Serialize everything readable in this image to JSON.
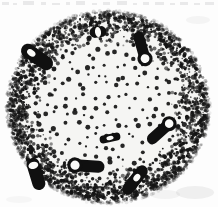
{
  "figure": {
    "medium": "stippled line drawing, scanned halftone",
    "background_color": "#fdfdfd",
    "ink_color": "#101010",
    "paper_tone": "#f5f5f3",
    "top_edge_artifact": "cut-off text descenders from line above, illegible",
    "alt_text": "Black and white stippled drawing of a circular plant stem cross-section containing eight dark vascular bundles and dense stippling at the rim."
  },
  "section": {
    "shape": "ellipse",
    "center_x": 108,
    "center_y": 107,
    "radius_x": 97,
    "radius_y": 92,
    "rim_label": "dense peripheral stippling",
    "core_label": "sparse parenchyma stippling"
  },
  "stipple": {
    "rim_dot_count": 2600,
    "core_dot_count": 430,
    "rim_dot_min_size": 0.7,
    "rim_dot_max_size": 2.1,
    "core_dot_min_size": 1.1,
    "core_dot_max_size": 2.6,
    "rim_band_inner": 0.62,
    "core_spacing": 10,
    "color": "#141414"
  },
  "bundles": [
    {
      "name": "bundle-top-center",
      "type": "ring",
      "cx": 98,
      "cy": 32,
      "length": 17,
      "width": 11,
      "angle": -8,
      "lacuna_rx": 3.0,
      "lacuna_ry": 5.0,
      "lacuna_offset": 0
    },
    {
      "name": "bundle-upper-left",
      "type": "bar-lacuna",
      "cx": 37,
      "cy": 57,
      "length": 36,
      "width": 14,
      "angle": 35,
      "lacuna_rx": 4.6,
      "lacuna_ry": 3.1,
      "lacuna_offset": -7
    },
    {
      "name": "bundle-upper-right",
      "type": "key",
      "cx": 142,
      "cy": 48,
      "length": 34,
      "width": 11,
      "angle": 74,
      "lacuna_rx": 4.4,
      "lacuna_ry": 4.4,
      "lacuna_offset": 11
    },
    {
      "name": "bundle-mid-right",
      "type": "key",
      "cx": 161,
      "cy": 131,
      "length": 34,
      "width": 11,
      "angle": -42,
      "lacuna_rx": 4.3,
      "lacuna_ry": 4.3,
      "lacuna_offset": 11
    },
    {
      "name": "bundle-center",
      "type": "lens",
      "cx": 110,
      "cy": 138,
      "length": 21,
      "width": 8,
      "angle": -12,
      "lacuna_rx": 3.6,
      "lacuna_ry": 2.1,
      "lacuna_offset": 0
    },
    {
      "name": "bundle-lower-left",
      "type": "bar-lacuna",
      "cx": 36,
      "cy": 174,
      "length": 33,
      "width": 13,
      "angle": 73,
      "lacuna_rx": 3.5,
      "lacuna_ry": 5.0,
      "lacuna_offset": -9
    },
    {
      "name": "bundle-lower-center",
      "type": "key",
      "cx": 87,
      "cy": 166,
      "length": 35,
      "width": 12,
      "angle": 4,
      "lacuna_rx": 4.6,
      "lacuna_ry": 4.6,
      "lacuna_offset": -12
    },
    {
      "name": "bundle-lower-right",
      "type": "bar-lacuna",
      "cx": 135,
      "cy": 180,
      "length": 34,
      "width": 12,
      "angle": -52,
      "lacuna_rx": 4.1,
      "lacuna_ry": 3.0,
      "lacuna_offset": 3
    }
  ],
  "smudges": [
    {
      "x": 176,
      "y": 186,
      "w": 38,
      "h": 13,
      "opacity": 0.14
    },
    {
      "x": 150,
      "y": 190,
      "w": 30,
      "h": 9,
      "opacity": 0.1
    },
    {
      "x": 186,
      "y": 16,
      "w": 24,
      "h": 8,
      "opacity": 0.09
    },
    {
      "x": 6,
      "y": 196,
      "w": 26,
      "h": 7,
      "opacity": 0.07
    }
  ],
  "top_noise_marks": [
    {
      "x": 2,
      "w": 7,
      "h": 3,
      "y": 2
    },
    {
      "x": 13,
      "w": 4,
      "h": 2,
      "y": 3
    },
    {
      "x": 23,
      "w": 11,
      "h": 4,
      "y": 1
    },
    {
      "x": 41,
      "w": 5,
      "h": 3,
      "y": 2
    },
    {
      "x": 52,
      "w": 8,
      "h": 2,
      "y": 3
    },
    {
      "x": 66,
      "w": 4,
      "h": 3,
      "y": 2
    },
    {
      "x": 76,
      "w": 9,
      "h": 4,
      "y": 1
    },
    {
      "x": 92,
      "w": 5,
      "h": 2,
      "y": 3
    },
    {
      "x": 103,
      "w": 7,
      "h": 3,
      "y": 2
    },
    {
      "x": 117,
      "w": 10,
      "h": 4,
      "y": 1
    },
    {
      "x": 133,
      "w": 4,
      "h": 2,
      "y": 3
    },
    {
      "x": 143,
      "w": 6,
      "h": 3,
      "y": 2
    },
    {
      "x": 155,
      "w": 9,
      "h": 3,
      "y": 2
    },
    {
      "x": 170,
      "w": 5,
      "h": 2,
      "y": 3
    },
    {
      "x": 180,
      "w": 8,
      "h": 3,
      "y": 2
    },
    {
      "x": 194,
      "w": 6,
      "h": 2,
      "y": 3
    },
    {
      "x": 205,
      "w": 9,
      "h": 3,
      "y": 2
    }
  ]
}
